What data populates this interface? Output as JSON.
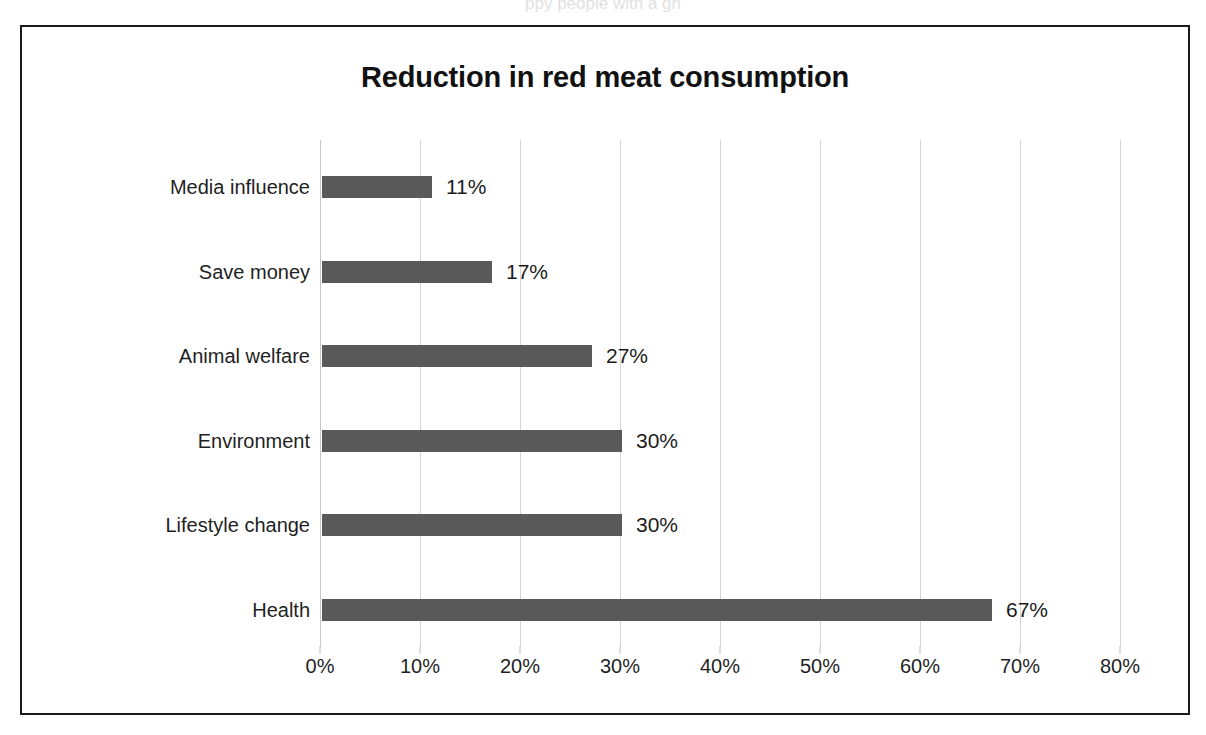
{
  "figure": {
    "clipped_text_above": "ppy people with a gh",
    "frame_border_color": "#1a1a1a",
    "background_color": "#ffffff"
  },
  "chart_data": {
    "type": "bar",
    "orientation": "horizontal",
    "title": "Reduction in red meat consumption",
    "xlabel": "",
    "ylabel": "",
    "categories": [
      "Health",
      "Lifestyle change",
      "Environment",
      "Animal welfare",
      "Save money",
      "Media influence"
    ],
    "values": [
      67,
      30,
      30,
      27,
      17,
      11
    ],
    "value_labels": [
      "67%",
      "30%",
      "30%",
      "27%",
      "17%",
      "11%"
    ],
    "xlim": [
      0,
      80
    ],
    "xticks": [
      0,
      10,
      20,
      30,
      40,
      50,
      60,
      70,
      80
    ],
    "xtick_labels": [
      "0%",
      "10%",
      "20%",
      "30%",
      "40%",
      "50%",
      "60%",
      "70%",
      "80%"
    ],
    "grid": true,
    "grid_axis": "x",
    "grid_color": "#d4d4d4",
    "legend": false,
    "bar_color": "#595959",
    "data_labels": true,
    "data_label_position": "outside-end"
  }
}
